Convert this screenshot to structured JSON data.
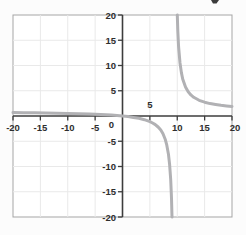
{
  "chart_data": {
    "type": "line",
    "title": "",
    "xlabel": "",
    "ylabel": "",
    "xlim": [
      -20,
      20
    ],
    "ylim": [
      -20,
      20
    ],
    "grid": true,
    "grid_step": 5,
    "legend": "none",
    "function_description": "rational function, approx. y = x/(x-9.5); vertical asymptote x ≈ 9.5, horizontal asymptote y ≈ 1, passes through origin",
    "x_ticks": [
      {
        "value": -20,
        "label": "-20",
        "side": "below"
      },
      {
        "value": -15,
        "label": "-15",
        "side": "below"
      },
      {
        "value": -10,
        "label": "-10",
        "side": "below"
      },
      {
        "value": -5,
        "label": "-5",
        "side": "below"
      },
      {
        "value": 0,
        "label": "0",
        "side": "below-left"
      },
      {
        "value": 5,
        "label": "5",
        "side": "above"
      },
      {
        "value": 10,
        "label": "10",
        "side": "below"
      },
      {
        "value": 15,
        "label": "15",
        "side": "below"
      },
      {
        "value": 20,
        "label": "20",
        "side": "below"
      }
    ],
    "y_ticks": [
      {
        "value": 20,
        "label": "20"
      },
      {
        "value": 15,
        "label": "15"
      },
      {
        "value": 10,
        "label": "10"
      },
      {
        "value": 5,
        "label": "5"
      },
      {
        "value": -5,
        "label": "-5"
      },
      {
        "value": -10,
        "label": "-10"
      },
      {
        "value": -15,
        "label": "-15"
      },
      {
        "value": -20,
        "label": "-20"
      }
    ],
    "series": [
      {
        "name": "left-branch",
        "points": [
          [
            -20,
            0.68
          ],
          [
            -18,
            0.65
          ],
          [
            -16,
            0.63
          ],
          [
            -14,
            0.6
          ],
          [
            -12,
            0.56
          ],
          [
            -10,
            0.51
          ],
          [
            -8,
            0.46
          ],
          [
            -6,
            0.39
          ],
          [
            -4,
            0.3
          ],
          [
            -2,
            0.17
          ],
          [
            -1,
            0.1
          ],
          [
            0,
            0
          ],
          [
            1,
            -0.12
          ],
          [
            2,
            -0.27
          ],
          [
            3,
            -0.46
          ],
          [
            4,
            -0.73
          ],
          [
            5,
            -1.11
          ],
          [
            5.5,
            -1.38
          ],
          [
            6,
            -1.71
          ],
          [
            6.5,
            -2.17
          ],
          [
            7,
            -2.8
          ],
          [
            7.4,
            -3.52
          ],
          [
            7.8,
            -4.59
          ],
          [
            8.1,
            -5.79
          ],
          [
            8.4,
            -7.64
          ],
          [
            8.6,
            -9.56
          ],
          [
            8.8,
            -12.57
          ],
          [
            8.95,
            -16.27
          ],
          [
            9.05,
            -20
          ]
        ]
      },
      {
        "name": "right-branch",
        "points": [
          [
            10,
            20
          ],
          [
            10.1,
            16.83
          ],
          [
            10.25,
            13.67
          ],
          [
            10.5,
            10.5
          ],
          [
            10.75,
            8.6
          ],
          [
            11,
            7.33
          ],
          [
            11.5,
            5.75
          ],
          [
            12,
            4.8
          ],
          [
            12.5,
            4.17
          ],
          [
            13,
            3.71
          ],
          [
            14,
            3.11
          ],
          [
            15,
            2.73
          ],
          [
            16,
            2.46
          ],
          [
            17,
            2.27
          ],
          [
            18,
            2.12
          ],
          [
            19,
            2.0
          ],
          [
            20,
            1.9
          ]
        ]
      }
    ],
    "colors": {
      "curve": "#b1b1b4",
      "axis": "#3d3d3d",
      "grid": "#e9e9e9",
      "frame": "#a5a5a5",
      "label": "#2e2e2e",
      "plot_background": "#ffffff",
      "page_background": "#fcfcfc",
      "artifact": "#3c3c3c"
    },
    "misc": {
      "top_edge_mark": "cropped text fragment at top-right edge"
    }
  }
}
